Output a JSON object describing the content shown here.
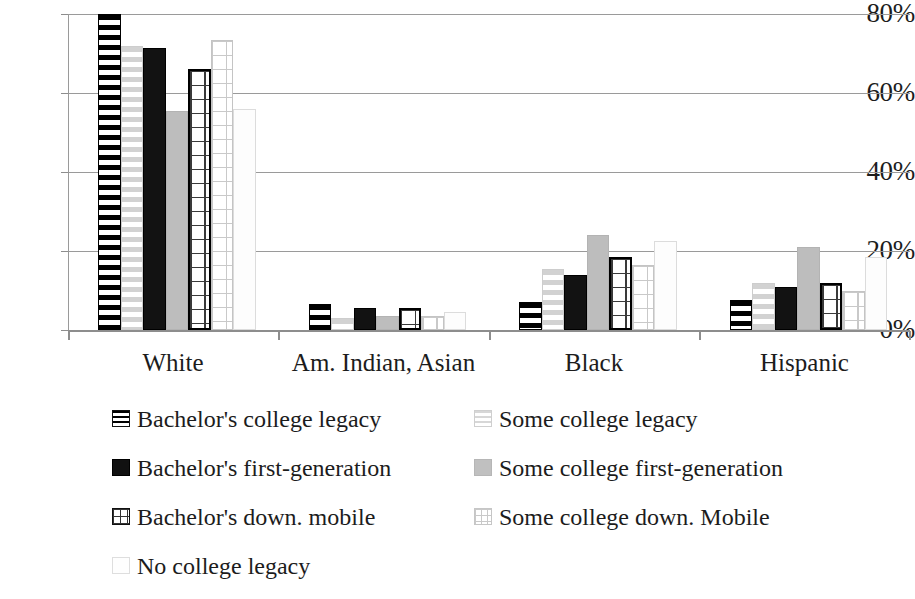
{
  "chart_data": {
    "type": "bar",
    "title": "",
    "subtitle": "",
    "xlabel": "",
    "ylabel": "",
    "ylim": [
      0,
      80
    ],
    "y_tick_labels": [
      "0%",
      "20%",
      "40%",
      "60%",
      "80%"
    ],
    "y_tick_values": [
      0,
      20,
      40,
      60,
      80
    ],
    "grid": true,
    "legend_position": "bottom",
    "value_format": "percent",
    "categories": [
      "White",
      "Am. Indian, Asian",
      "Black",
      "Hispanic"
    ],
    "series": [
      {
        "name": "Bachelor's college legacy",
        "pattern": "horizontal-stripe-dark",
        "values": [
          80,
          6.5,
          7,
          7.5
        ]
      },
      {
        "name": "Some college legacy",
        "pattern": "horizontal-stripe-light",
        "values": [
          72,
          3,
          15.5,
          12
        ]
      },
      {
        "name": "Bachelor's first-generation",
        "pattern": "solid-black",
        "values": [
          71.5,
          5.5,
          14,
          11
        ]
      },
      {
        "name": "Some college first-generation",
        "pattern": "solid-gray",
        "values": [
          55.5,
          3.5,
          24,
          21
        ]
      },
      {
        "name": "Bachelor's down. mobile",
        "pattern": "grid-dark",
        "values": [
          66,
          5.5,
          18.5,
          12
        ]
      },
      {
        "name": "Some college down. Mobile",
        "pattern": "grid-light",
        "values": [
          73.5,
          3.5,
          16.5,
          10
        ]
      },
      {
        "name": "No college legacy",
        "pattern": "empty",
        "values": [
          56,
          4.5,
          22.5,
          18.5
        ]
      }
    ]
  },
  "legend": {
    "rows": [
      {
        "col1": "Bachelor's college legacy",
        "col2": "Some college legacy"
      },
      {
        "col1": "Bachelor's first-generation",
        "col2": "Some college first-generation"
      },
      {
        "col1": "Bachelor's down. mobile",
        "col2": "Some college down. Mobile"
      },
      {
        "col1": "No college legacy",
        "col2": ""
      }
    ]
  },
  "axis": {
    "y_labels": [
      "80%",
      "60%",
      "40%",
      "20%",
      "0%"
    ],
    "x_labels": [
      "White",
      "Am. Indian, Asian",
      "Black",
      "Hispanic"
    ]
  },
  "colors": {
    "dark": "#121212",
    "gray": "#bdbdbd",
    "light_gray": "#d2d2d2",
    "gridline": "#9a9a9a",
    "text": "#1c1c1c",
    "background": "#ffffff"
  }
}
